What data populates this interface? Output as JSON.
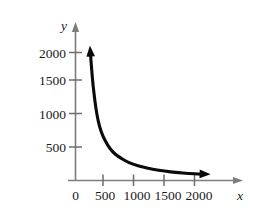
{
  "chart_data": {
    "type": "line",
    "title": "",
    "subtitle": "",
    "xlabel": "x",
    "ylabel": "y",
    "xlim": [
      0,
      2250
    ],
    "ylim": [
      0,
      2150
    ],
    "grid": false,
    "legend": null,
    "x_ticks": [
      0,
      500,
      1000,
      1500,
      2000
    ],
    "x_tick_labels": [
      "0",
      "500",
      "1000",
      "1500",
      "2000"
    ],
    "y_ticks": [
      500,
      1000,
      1500,
      2000
    ],
    "y_tick_labels": [
      "500",
      "1000",
      "1500",
      "2000"
    ],
    "series": [
      {
        "name": "decay-curve",
        "style": "solid",
        "color": "#0a0a0a",
        "arrow_start": "up",
        "arrow_end": "right",
        "x": [
          250,
          275,
          300,
          340,
          380,
          430,
          500,
          580,
          670,
          780,
          900,
          1050,
          1200,
          1400,
          1600,
          1800,
          2000,
          2170
        ],
        "y": [
          2000,
          1700,
          1450,
          1150,
          940,
          770,
          620,
          500,
          410,
          340,
          280,
          230,
          195,
          160,
          135,
          118,
          105,
          98
        ]
      }
    ],
    "annotations": []
  },
  "axes": {
    "x_axis_name": "x",
    "y_axis_name": "y",
    "axis_color": "#7d7d7d",
    "curve_color": "#0a0a0a"
  }
}
